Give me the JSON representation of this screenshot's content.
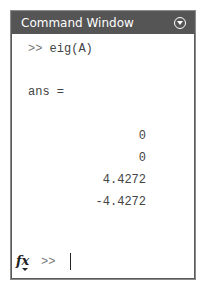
{
  "window": {
    "title": "Command Window",
    "menu_icon": "chevron-down-circle-icon"
  },
  "session": {
    "command_prompt": ">>",
    "command": "eig(A)",
    "result_label": "ans =",
    "values": [
      "0",
      "0",
      "4.4272",
      "-4.4272"
    ],
    "input_prompt": ">>",
    "fx_label": "fx"
  },
  "colors": {
    "titlebar_bg": "#555555",
    "titlebar_text": "#ffffff",
    "border": "#5a5a5a"
  }
}
